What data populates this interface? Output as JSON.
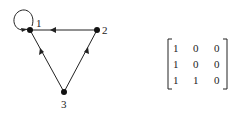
{
  "graph": {
    "nodes": [
      {
        "id": "1",
        "label": "1",
        "x": 30,
        "y": 30
      },
      {
        "id": "2",
        "label": "2",
        "x": 97,
        "y": 30
      },
      {
        "id": "3",
        "label": "3",
        "x": 64,
        "y": 92
      }
    ],
    "edges": [
      {
        "from": "1",
        "to": "1",
        "type": "self-loop"
      },
      {
        "from": "2",
        "to": "1"
      },
      {
        "from": "3",
        "to": "1"
      },
      {
        "from": "3",
        "to": "2"
      }
    ]
  },
  "matrix": {
    "rows": [
      [
        "1",
        "0",
        "0"
      ],
      [
        "1",
        "0",
        "0"
      ],
      [
        "1",
        "1",
        "0"
      ]
    ]
  },
  "colors": {
    "ink": "#222222",
    "background": "#ffffff"
  }
}
